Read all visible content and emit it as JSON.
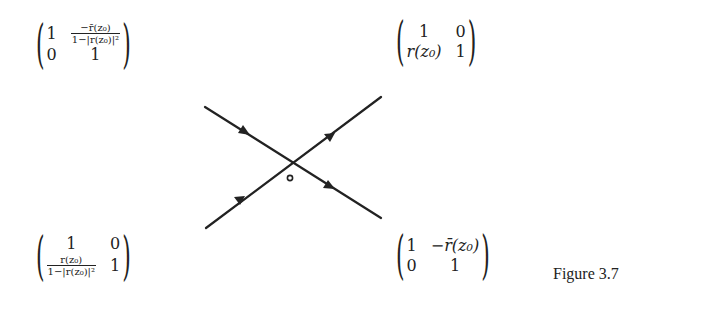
{
  "figure": {
    "caption": "Figure 3.7",
    "matrices": {
      "top_left": {
        "r1c1": "1",
        "r1c2_num": "−r̄(z₀)",
        "r1c2_den": "1−|r(z₀)|²",
        "r2c1": "0",
        "r2c2": "1"
      },
      "top_right": {
        "r1c1": "1",
        "r1c2": "0",
        "r2c1": "r(z₀)",
        "r2c2": "1"
      },
      "bottom_left": {
        "r1c1": "1",
        "r1c2": "0",
        "r2c1_num": "r(z₀)",
        "r2c1_den": "1−|r(z₀)|²",
        "r2c2": "1"
      },
      "bottom_right": {
        "r1c1": "1",
        "r1c2": "−r̄(z₀)",
        "r2c1": "0",
        "r2c2": "1"
      }
    },
    "contour": {
      "center_point_label": "",
      "lines": [
        {
          "from": [
            205,
            107
          ],
          "to": [
            381,
            218
          ],
          "arrows_at": [
            [
              245,
              132
            ],
            [
              330,
              187
            ]
          ]
        },
        {
          "from": [
            206,
            228
          ],
          "to": [
            381,
            97
          ],
          "arrows_at": [
            [
              240,
              200
            ],
            [
              330,
              137
            ]
          ]
        }
      ],
      "center_marker": [
        290,
        178
      ]
    }
  }
}
